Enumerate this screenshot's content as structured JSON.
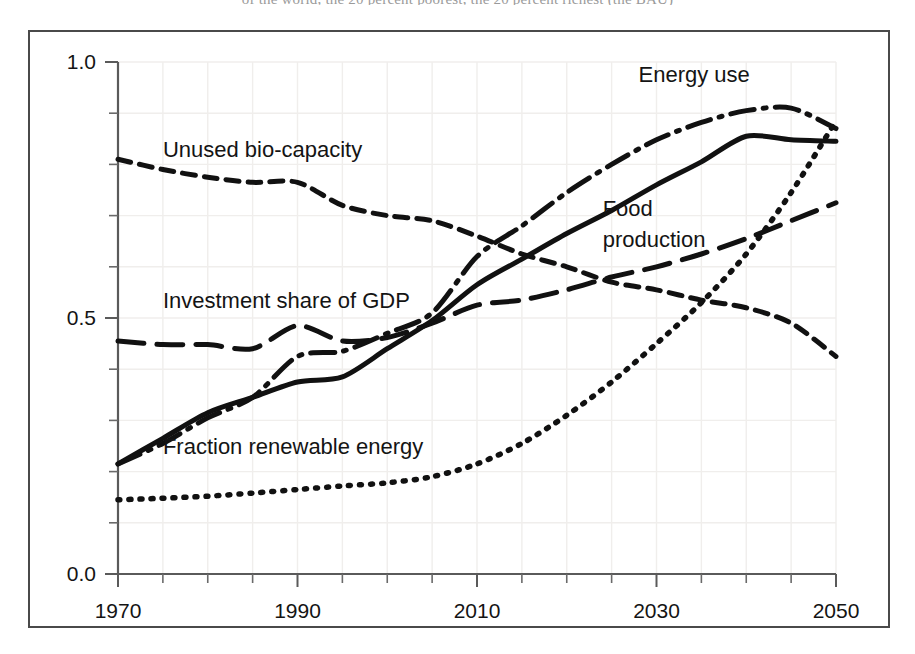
{
  "figure": {
    "caption_sliver": "of the world, the 20 percent poorest, the 20 percent richest (the BAU)",
    "background": "#ffffff",
    "frame_color": "#4a4a4a",
    "ink_color": "#111111"
  },
  "chart_data": {
    "type": "line",
    "title": "",
    "subtitle": "",
    "xlabel": "",
    "ylabel": "",
    "xlim": [
      1970,
      2050
    ],
    "ylim": [
      0.0,
      1.0
    ],
    "grid": true,
    "legend_position": "inline-annotations",
    "x_ticks_major": [
      1970,
      1990,
      2010,
      2030,
      2050
    ],
    "x_tick_labels": [
      "1970",
      "1990",
      "2010",
      "2030",
      "2050"
    ],
    "x_tick_minor_step": 5,
    "y_ticks_major": [
      0.0,
      0.5,
      1.0
    ],
    "y_tick_labels": [
      "0.0",
      "0.5",
      "1.0"
    ],
    "y_tick_minor_step": 0.1,
    "x": [
      1970,
      1975,
      1980,
      1985,
      1990,
      1995,
      2000,
      2005,
      2010,
      2015,
      2020,
      2025,
      2030,
      2035,
      2040,
      2045,
      2050
    ],
    "series": [
      {
        "name": "Unused bio-capacity",
        "style": "dashed-short",
        "dasharray": "13,9",
        "width": 5,
        "label_x": 1975,
        "label_y": 0.815,
        "values": [
          0.81,
          0.79,
          0.775,
          0.765,
          0.765,
          0.72,
          0.7,
          0.69,
          0.66,
          0.625,
          0.6,
          0.57,
          0.555,
          0.535,
          0.52,
          0.49,
          0.425
        ]
      },
      {
        "name": "Investment share of GDP",
        "style": "dashed-long",
        "dasharray": "26,13",
        "width": 5,
        "label_x": 1975,
        "label_y": 0.52,
        "values": [
          0.455,
          0.448,
          0.448,
          0.44,
          0.485,
          0.455,
          0.462,
          0.49,
          0.525,
          0.535,
          0.555,
          0.58,
          0.6,
          0.625,
          0.655,
          0.69,
          0.725
        ]
      },
      {
        "name": "Food production",
        "style": "solid",
        "dasharray": "",
        "width": 5,
        "label_x": 2024,
        "label_y": 0.7,
        "label_lines": [
          "Food",
          "production"
        ],
        "values": [
          0.215,
          0.265,
          0.315,
          0.345,
          0.375,
          0.385,
          0.44,
          0.495,
          0.565,
          0.615,
          0.665,
          0.71,
          0.76,
          0.805,
          0.855,
          0.848,
          0.845
        ]
      },
      {
        "name": "Energy use",
        "style": "dash-dot",
        "dasharray": "24,9,3,9",
        "width": 5,
        "label_x": 2028,
        "label_y": 0.96,
        "values": [
          0.215,
          0.255,
          0.305,
          0.345,
          0.425,
          0.435,
          0.47,
          0.51,
          0.62,
          0.68,
          0.745,
          0.8,
          0.848,
          0.882,
          0.905,
          0.91,
          0.87
        ]
      },
      {
        "name": "Fraction renewable energy",
        "style": "dotted",
        "dasharray": "2,9",
        "width": 5.5,
        "label_x": 1975,
        "label_y": 0.235,
        "values": [
          0.145,
          0.148,
          0.152,
          0.158,
          0.165,
          0.172,
          0.178,
          0.19,
          0.215,
          0.255,
          0.31,
          0.375,
          0.45,
          0.53,
          0.625,
          0.745,
          0.885
        ]
      }
    ]
  }
}
